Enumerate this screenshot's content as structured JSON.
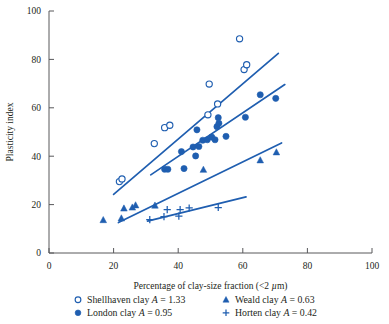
{
  "chart_data": {
    "type": "scatter",
    "title": "",
    "xlabel": "Percentage of clay-size fraction (<2 µm)",
    "ylabel": "Plasticity index",
    "xlim": [
      0,
      100
    ],
    "ylim": [
      0,
      100
    ],
    "xticks": [
      0,
      20,
      40,
      60,
      80,
      100
    ],
    "yticks": [
      0,
      20,
      40,
      60,
      80,
      100
    ],
    "grid": false,
    "legend_position": "below-axes",
    "accent_color": "#1f5eb0",
    "axis_color": "#58585b",
    "text_color": "#231f20",
    "series": [
      {
        "name": "Shellhaven clay",
        "activity_label": "A = 1.33",
        "activity": 1.33,
        "marker": "open-circle",
        "color": "#1f5eb0",
        "points": [
          [
            21.8,
            29.5
          ],
          [
            22.6,
            30.6
          ],
          [
            32.6,
            45.2
          ],
          [
            35.8,
            51.8
          ],
          [
            37.4,
            52.8
          ],
          [
            49.2,
            57.1
          ],
          [
            49.6,
            69.8
          ],
          [
            52.2,
            61.6
          ],
          [
            59.0,
            88.5
          ],
          [
            60.4,
            75.8
          ],
          [
            61.2,
            77.8
          ]
        ],
        "trendline": [
          [
            20.0,
            24.2
          ],
          [
            71.0,
            82.5
          ]
        ]
      },
      {
        "name": "London clay",
        "activity_label": "A = 0.95",
        "activity": 0.95,
        "marker": "filled-circle",
        "color": "#1f5eb0",
        "points": [
          [
            35.8,
            34.6
          ],
          [
            36.8,
            34.6
          ],
          [
            41.0,
            41.9
          ],
          [
            41.8,
            34.9
          ],
          [
            44.6,
            43.8
          ],
          [
            45.4,
            40.1
          ],
          [
            45.8,
            50.9
          ],
          [
            46.4,
            44.0
          ],
          [
            47.6,
            46.6
          ],
          [
            49.0,
            46.8
          ],
          [
            50.4,
            47.9
          ],
          [
            51.4,
            46.8
          ],
          [
            52.0,
            52.2
          ],
          [
            52.4,
            55.9
          ],
          [
            52.6,
            53.6
          ],
          [
            54.8,
            48.2
          ],
          [
            60.8,
            56.1
          ],
          [
            65.4,
            65.4
          ],
          [
            70.2,
            63.9
          ]
        ],
        "trendline": [
          [
            31.5,
            32.3
          ],
          [
            73.0,
            69.6
          ]
        ]
      },
      {
        "name": "Weald clay",
        "activity_label": "A = 0.63",
        "activity": 0.63,
        "marker": "filled-triangle",
        "color": "#1f5eb0",
        "points": [
          [
            16.8,
            13.6
          ],
          [
            22.4,
            14.3
          ],
          [
            23.2,
            18.4
          ],
          [
            25.8,
            18.8
          ],
          [
            26.8,
            19.7
          ],
          [
            32.8,
            19.6
          ],
          [
            47.8,
            34.4
          ],
          [
            65.4,
            38.3
          ],
          [
            70.4,
            41.6
          ]
        ],
        "trendline": [
          [
            21.5,
            12.6
          ],
          [
            72.0,
            45.5
          ]
        ]
      },
      {
        "name": "Horten clay",
        "activity_label": "A = 0.42",
        "activity": 0.42,
        "marker": "plus",
        "color": "#1f5eb0",
        "points": [
          [
            31.2,
            13.8
          ],
          [
            35.6,
            15.0
          ],
          [
            36.6,
            17.9
          ],
          [
            40.2,
            15.2
          ],
          [
            40.6,
            17.9
          ],
          [
            43.4,
            18.6
          ],
          [
            52.4,
            18.8
          ]
        ],
        "trendline": [
          [
            30.5,
            13.2
          ],
          [
            61.0,
            23.2
          ]
        ]
      }
    ]
  },
  "legend": {
    "items": [
      {
        "marker": "open-circle",
        "label": "Shellhaven clay",
        "symbol": "A",
        "value": "= 1.33"
      },
      {
        "marker": "filled-circle",
        "label": "London clay",
        "symbol": "A",
        "value": "= 0.95"
      },
      {
        "marker": "filled-triangle",
        "label": "Weald clay",
        "symbol": "A",
        "value": "= 0.63"
      },
      {
        "marker": "plus",
        "label": "Horten clay",
        "symbol": "A",
        "value": "= 0.42"
      }
    ]
  }
}
